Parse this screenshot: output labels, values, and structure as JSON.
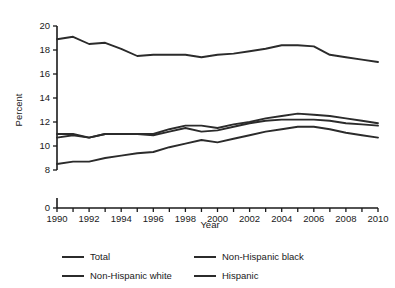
{
  "chart_data": {
    "type": "line",
    "title": "",
    "subtitle": "",
    "xlabel": "Year",
    "ylabel": "Percent",
    "xlim": [
      1990,
      2010
    ],
    "ylim": [
      8,
      20
    ],
    "y_axis_break": true,
    "y_zero_label": "0",
    "grid": false,
    "legend_position": "bottom",
    "x": [
      1990,
      1991,
      1992,
      1993,
      1994,
      1995,
      1996,
      1997,
      1998,
      1999,
      2000,
      2001,
      2002,
      2003,
      2004,
      2005,
      2006,
      2007,
      2008,
      2009,
      2010
    ],
    "xticklabels": [
      "1990",
      "1992",
      "1994",
      "1996",
      "1998",
      "2000",
      "2002",
      "2004",
      "2006",
      "2008",
      "2010"
    ],
    "yticklabels": [
      "0",
      "8",
      "10",
      "12",
      "14",
      "16",
      "18",
      "20"
    ],
    "series": [
      {
        "name": "Total",
        "values": [
          11.0,
          11.0,
          10.7,
          11.0,
          11.0,
          11.0,
          10.9,
          11.2,
          11.5,
          11.2,
          11.3,
          11.6,
          11.9,
          12.1,
          12.2,
          12.2,
          12.2,
          12.1,
          11.9,
          11.8,
          11.7
        ]
      },
      {
        "name": "Non-Hispanic black",
        "values": [
          18.9,
          19.1,
          18.5,
          18.6,
          18.1,
          17.5,
          17.6,
          17.6,
          17.6,
          17.4,
          17.6,
          17.7,
          17.9,
          18.1,
          18.4,
          18.4,
          18.3,
          17.6,
          17.4,
          17.2,
          17.0
        ]
      },
      {
        "name": "Non-Hispanic white",
        "values": [
          10.7,
          10.9,
          10.7,
          11.0,
          11.0,
          11.0,
          11.0,
          11.4,
          11.7,
          11.7,
          11.5,
          11.8,
          12.0,
          12.3,
          12.5,
          12.7,
          12.6,
          12.5,
          12.3,
          12.1,
          11.9
        ]
      },
      {
        "name": "Hispanic",
        "values": [
          8.5,
          8.7,
          8.7,
          9.0,
          9.2,
          9.4,
          9.5,
          9.9,
          10.2,
          10.5,
          10.3,
          10.6,
          10.9,
          11.2,
          11.4,
          11.6,
          11.6,
          11.4,
          11.1,
          10.9,
          10.7
        ]
      }
    ]
  },
  "axes": {
    "ylabel": "Percent",
    "xlabel": "Year",
    "yticks": [
      "0",
      "8",
      "10",
      "12",
      "14",
      "16",
      "18",
      "20"
    ],
    "xticks": [
      "1990",
      "1992",
      "1994",
      "1996",
      "1998",
      "2000",
      "2002",
      "2004",
      "2006",
      "2008",
      "2010"
    ]
  },
  "legend": {
    "items": [
      {
        "label": "Total"
      },
      {
        "label": "Non-Hispanic black"
      },
      {
        "label": "Non-Hispanic white"
      },
      {
        "label": "Hispanic"
      }
    ]
  },
  "colors": {
    "line": "#2b2b2b",
    "axis": "#1a1a1a",
    "background": "#ffffff"
  }
}
